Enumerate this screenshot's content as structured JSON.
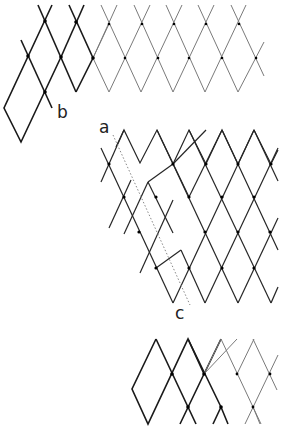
{
  "figure": {
    "labels": {
      "a": "a",
      "b": "b",
      "c": "c"
    },
    "colors": {
      "bold_line": "#1a1a1a",
      "thin_line": "#7a7a7a",
      "dot": "#000000",
      "dotted_line": "#888888",
      "background": "#ffffff"
    },
    "panels": [
      {
        "name": "top-lattice",
        "description": "Rhombic lattice: bold left portion with displaced rhombus at b, thin right portion"
      },
      {
        "name": "middle-lattice",
        "description": "Rhombic lattice with dotted line a–c marking a shear/slip plane"
      },
      {
        "name": "bottom-lattice",
        "description": "Rhombic lattice strip: bold left rhombi, thin right rhombi"
      }
    ]
  }
}
